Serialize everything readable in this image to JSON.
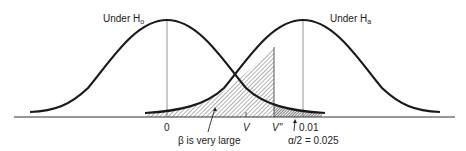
{
  "figure": {
    "title_h0": "Under H",
    "title_h0_sub": "o",
    "title_ha": "Under H",
    "title_ha_sub": "a",
    "axis_labels": {
      "zero": "0",
      "v": "V",
      "v_double_prime": "V''",
      "point_01": "0.01"
    },
    "annotations": {
      "beta": "β is very large",
      "alpha": "α/2 = 0.025"
    },
    "colors": {
      "curve": "#1a1a1a",
      "axis": "#333333",
      "hatch": "#555555"
    }
  }
}
